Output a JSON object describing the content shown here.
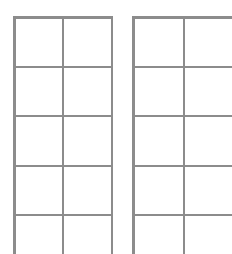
{
  "canvas": {
    "width": 232,
    "height": 254,
    "background": "#ffffff"
  },
  "style": {
    "line_color": "#8c8c8c",
    "outer_line_width": 2,
    "inner_line_width": 2
  },
  "grids": [
    {
      "name": "left-grid",
      "left": 14,
      "top": 17,
      "col_lines_x": [
        14,
        63,
        112
      ],
      "row_lines_y": [
        17,
        67,
        116,
        166,
        215
      ],
      "bottom": 254,
      "columns": 2,
      "rows_visible": 5
    },
    {
      "name": "right-grid",
      "left": 133,
      "top": 17,
      "col_lines_x": [
        133,
        184
      ],
      "row_lines_y": [
        17,
        67,
        116,
        166,
        215
      ],
      "right": 232,
      "bottom": 254,
      "columns": 2,
      "rows_visible": 5
    }
  ]
}
